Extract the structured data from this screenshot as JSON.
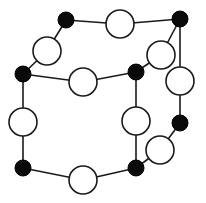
{
  "diagram": {
    "colors": {
      "black_node": "#0a0a0a",
      "white_node": "#ffffff",
      "edge": "#1a1a1a"
    },
    "nodes": [
      {
        "id": "b1",
        "type": "black",
        "x": 66,
        "y": 20,
        "r": 8
      },
      {
        "id": "b2",
        "type": "black",
        "x": 180,
        "y": 19,
        "r": 8
      },
      {
        "id": "b3",
        "type": "black",
        "x": 23,
        "y": 74,
        "r": 8
      },
      {
        "id": "b4",
        "type": "black",
        "x": 136,
        "y": 72,
        "r": 8
      },
      {
        "id": "b5",
        "type": "black",
        "x": 23,
        "y": 168,
        "r": 8
      },
      {
        "id": "b6",
        "type": "black",
        "x": 136,
        "y": 168,
        "r": 8
      },
      {
        "id": "b7",
        "type": "black",
        "x": 180,
        "y": 123,
        "r": 8
      },
      {
        "id": "w1",
        "type": "white",
        "x": 47,
        "y": 51,
        "r": 14
      },
      {
        "id": "w2",
        "type": "white",
        "x": 120,
        "y": 24,
        "r": 14
      },
      {
        "id": "w3",
        "type": "white",
        "x": 161,
        "y": 55,
        "r": 14
      },
      {
        "id": "w4",
        "type": "white",
        "x": 83,
        "y": 82,
        "r": 14
      },
      {
        "id": "w5",
        "type": "white",
        "x": 180,
        "y": 81,
        "r": 14
      },
      {
        "id": "w6",
        "type": "white",
        "x": 23,
        "y": 122,
        "r": 14
      },
      {
        "id": "w7",
        "type": "white",
        "x": 136,
        "y": 121,
        "r": 14
      },
      {
        "id": "w8",
        "type": "white",
        "x": 83,
        "y": 180,
        "r": 14
      },
      {
        "id": "w9",
        "type": "white",
        "x": 160,
        "y": 150,
        "r": 14
      }
    ],
    "edges": [
      [
        "b1",
        "w1"
      ],
      [
        "w1",
        "b3"
      ],
      [
        "b1",
        "w2"
      ],
      [
        "w2",
        "b2"
      ],
      [
        "b2",
        "w3"
      ],
      [
        "w3",
        "b4"
      ],
      [
        "b3",
        "w4"
      ],
      [
        "w4",
        "b4"
      ],
      [
        "b2",
        "w5"
      ],
      [
        "w5",
        "b7"
      ],
      [
        "b3",
        "w6"
      ],
      [
        "w6",
        "b5"
      ],
      [
        "b4",
        "w7"
      ],
      [
        "w7",
        "b6"
      ],
      [
        "b5",
        "w8"
      ],
      [
        "w8",
        "b6"
      ],
      [
        "b6",
        "w9"
      ],
      [
        "w9",
        "b7"
      ]
    ]
  }
}
